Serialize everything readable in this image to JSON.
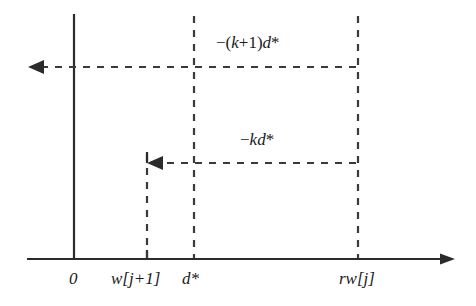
{
  "figure": {
    "background_color": "#ffffff",
    "line_color": "#2b2b2b",
    "axis": {
      "x_axis_name": "horizontal-axis",
      "y_axis_name": "vertical-axis",
      "x_axis_arrow": "right",
      "y_axis_arrow": "none"
    },
    "tick_labels": [
      {
        "id": "origin",
        "text": "0",
        "x": 74
      },
      {
        "id": "w-j-plus-1",
        "text": "w[j+1]",
        "x": 147
      },
      {
        "id": "d-star",
        "text": "d*",
        "x": 194
      },
      {
        "id": "rw-j",
        "text": "rw[j]",
        "x": 358
      }
    ],
    "annotations": [
      {
        "id": "upper-displacement",
        "text_prefix": "−(",
        "text": "−(k+1)d*",
        "parts": {
          "minus": "−",
          "open": "(",
          "k": "k",
          "plus": "+",
          "one": "1",
          "close": ")",
          "d": "d",
          "star": "*"
        },
        "y": 67,
        "direction": "left",
        "from_x": 358,
        "to_x": 28
      },
      {
        "id": "lower-displacement",
        "text": "−kd*",
        "parts": {
          "minus": "−",
          "k": "k",
          "d": "d",
          "star": "*"
        },
        "y": 163,
        "direction": "left",
        "from_x": 358,
        "to_x": 147
      }
    ],
    "vertical_guides": [
      {
        "id": "guide-w-j-plus-1",
        "x": 147,
        "top": 163,
        "bottom": 259
      },
      {
        "id": "guide-d-star",
        "x": 194,
        "top": 16,
        "bottom": 259
      },
      {
        "id": "guide-rw-j",
        "x": 358,
        "top": 16,
        "bottom": 259
      }
    ]
  }
}
